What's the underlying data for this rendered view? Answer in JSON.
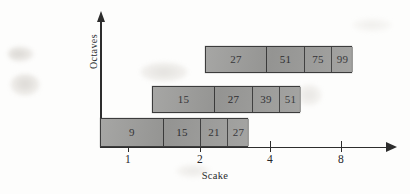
{
  "figure": {
    "x_axis_title": "Scake",
    "y_axis_title": "Octaves"
  },
  "chart_data": {
    "type": "bar",
    "orientation": "horizontal",
    "title": "",
    "xlabel": "Scake",
    "ylabel": "Octaves",
    "x_tick_labels": [
      "1",
      "2",
      "4",
      "8"
    ],
    "x_tick_positions_px": [
      128,
      200,
      270,
      341
    ],
    "grid": false,
    "legend": null,
    "series": [
      {
        "name": "row-1",
        "row_index": 0,
        "values": [
          9,
          15,
          21,
          27
        ],
        "labels": [
          "9",
          "15",
          "21",
          "27"
        ]
      },
      {
        "name": "row-2",
        "row_index": 1,
        "values": [
          15,
          27,
          39,
          51
        ],
        "labels": [
          "15",
          "27",
          "39",
          "51"
        ]
      },
      {
        "name": "row-3",
        "row_index": 2,
        "values": [
          27,
          51,
          75,
          99
        ],
        "labels": [
          "27",
          "51",
          "75",
          "99"
        ]
      }
    ],
    "colors": {
      "bar_fill": "#9c9c9a",
      "bar_border": "#3c3c3c",
      "axis": "#2d2d2d",
      "text": "#2b2b2e",
      "background": "#fdfdfc"
    }
  }
}
